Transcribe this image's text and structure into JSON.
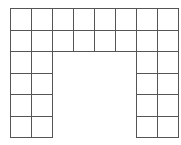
{
  "figure": {
    "origin_x": 10,
    "origin_y": 8,
    "cell_w": 21,
    "cell_h": 21.5,
    "cols": 8,
    "rows": 6,
    "line_color": "#555555",
    "fill_color": "#ffffff",
    "grid": [
      [
        1,
        1,
        1,
        1,
        1,
        1,
        1,
        1
      ],
      [
        1,
        1,
        1,
        1,
        1,
        1,
        1,
        1
      ],
      [
        1,
        1,
        0,
        0,
        0,
        0,
        1,
        1
      ],
      [
        1,
        1,
        0,
        0,
        0,
        0,
        1,
        1
      ],
      [
        1,
        1,
        0,
        0,
        0,
        0,
        1,
        1
      ],
      [
        1,
        1,
        0,
        0,
        0,
        0,
        1,
        1
      ]
    ],
    "cell_count": 32
  }
}
